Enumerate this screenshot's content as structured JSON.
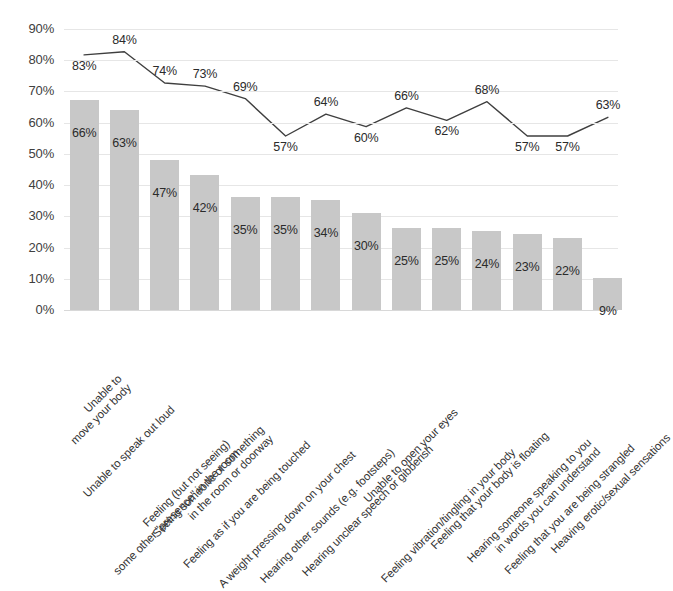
{
  "chart_data": {
    "type": "bar",
    "title": "",
    "subtitle": "",
    "xlabel": "",
    "ylabel": "",
    "ylim": [
      0,
      90
    ],
    "grid": true,
    "legend": "none",
    "ytick_labels": [
      "0%",
      "10%",
      "20%",
      "30%",
      "40%",
      "50%",
      "60%",
      "70%",
      "80%",
      "90%"
    ],
    "ytick_values": [
      0,
      10,
      20,
      30,
      40,
      50,
      60,
      70,
      80,
      90
    ],
    "categories": [
      "Unable to move your body",
      "Unable to speak out loud",
      "Feeling (but not seeing) some other \"presence\" in the room",
      "Seeing someone or something in the room or doorway",
      "Feeling as if you are being touched",
      "A weight pressing down on your chest",
      "Hearing other sounds (e.g. footsteps)",
      "Hearing unclear speech or gibberish",
      "Unable to open your eyes",
      "Feeling vibration/tingling in your body",
      "Feeling that your body is floating",
      "Hearing someone speaking to you in words you can understand",
      "Feeling that you are being strangled",
      "Heaving erotic/sexual sensations"
    ],
    "category_lines": [
      [
        "Unable to",
        "move your body"
      ],
      [
        "Unable to speak out loud"
      ],
      [
        "Feeling (but not seeing)",
        "some other \"presence\" in the room"
      ],
      [
        "Seeing someone or something",
        "in the room or doorway"
      ],
      [
        "Feeling as if you are being touched"
      ],
      [
        "A weight pressing down on your chest"
      ],
      [
        "Hearing other sounds (e.g. footsteps)"
      ],
      [
        "Hearing unclear speech or gibberish"
      ],
      [
        "Unable to open your eyes"
      ],
      [
        "Feeling vibration/tingling in your body"
      ],
      [
        "Feeling that your body is floating"
      ],
      [
        "Hearing someone speaking to you",
        "in words you can understand"
      ],
      [
        "Feeling that you are being strangled"
      ],
      [
        "Heaving erotic/sexual sensations"
      ]
    ],
    "series": [
      {
        "name": "bars",
        "render": "bar",
        "color": "#c8c8c8",
        "values": [
          66,
          63,
          47,
          42,
          35,
          35,
          34,
          30,
          25,
          25,
          24,
          23,
          22,
          9
        ],
        "labels": [
          "66%",
          "63%",
          "47%",
          "42%",
          "35%",
          "35%",
          "34%",
          "30%",
          "25%",
          "25%",
          "24%",
          "23%",
          "22%",
          "9%"
        ]
      },
      {
        "name": "line",
        "render": "line",
        "color": "#3f3f3f",
        "values": [
          83,
          84,
          74,
          73,
          69,
          57,
          64,
          60,
          66,
          62,
          68,
          57,
          57,
          63
        ],
        "labels": [
          "83%",
          "84%",
          "74%",
          "73%",
          "69%",
          "57%",
          "64%",
          "60%",
          "66%",
          "62%",
          "68%",
          "57%",
          "57%",
          "63%"
        ]
      }
    ]
  }
}
